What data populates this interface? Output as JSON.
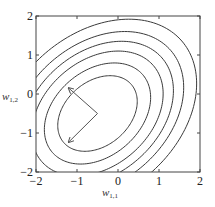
{
  "chart_data": {
    "type": "contour",
    "title": "",
    "xlabel": "w_{1,1}",
    "ylabel": "w_{1,2}",
    "xlabel_main": "w",
    "xlabel_sub": "1,1",
    "ylabel_main": "w",
    "ylabel_sub": "1,2",
    "xlim": [
      -2,
      2
    ],
    "ylim": [
      -2,
      2
    ],
    "x_ticks": [
      "-2",
      "-1",
      "0",
      "1",
      "2"
    ],
    "y_ticks": [
      "2",
      "1",
      "0",
      "-1",
      "-2"
    ],
    "grid": false,
    "legend": null,
    "contour_center": [
      -0.5,
      -0.5
    ],
    "ellipse_orientation_deg": 45,
    "base_semi_axes": {
      "major": 1.25,
      "minor": 0.9
    },
    "contour_scales": [
      0.89,
      1.19,
      1.47,
      1.7,
      1.93,
      2.22
    ],
    "arrows": [
      {
        "from": [
          -0.5,
          -0.5
        ],
        "to": [
          -1.2,
          0.15
        ],
        "direction": "eigenvector (-1, 1)"
      },
      {
        "from": [
          -0.5,
          -0.5
        ],
        "to": [
          -1.2,
          -1.23
        ],
        "direction": "eigenvector (-1, -1)"
      }
    ],
    "colors": {
      "contour": "#3a3a3a",
      "frame": "#444444",
      "arrow": "#555555"
    }
  }
}
